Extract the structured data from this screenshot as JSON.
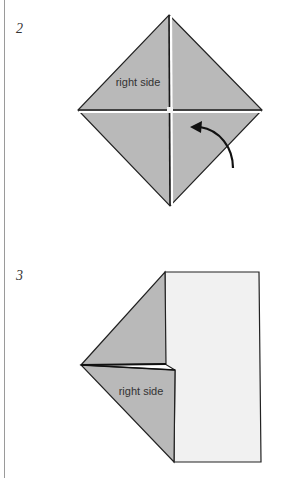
{
  "steps": [
    {
      "number": "2",
      "label": "right side",
      "shape": "diamond-with-cross-creases",
      "arrow": "curved-fold-arrow"
    },
    {
      "number": "3",
      "label": "right side",
      "shape": "rectangle-with-folded-triangle-flaps"
    }
  ],
  "colors": {
    "paper_colored": "#b9b9b9",
    "paper_white": "#f1f1f1",
    "outline": "#222222",
    "rule": "#9a9a9a"
  }
}
